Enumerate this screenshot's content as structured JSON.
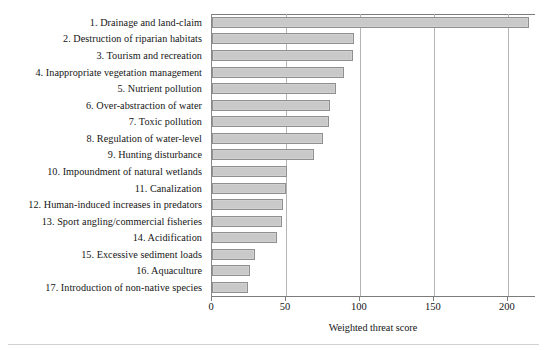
{
  "chart_data": {
    "type": "bar",
    "orientation": "horizontal",
    "title": "",
    "xlabel": "Weighted threat score",
    "ylabel": "",
    "xlim": [
      0,
      219
    ],
    "xticks": [
      0,
      50,
      100,
      150,
      200
    ],
    "xtick_labels": [
      "0",
      "50",
      "100",
      "150",
      "200"
    ],
    "grid": "vertical",
    "legend": "none",
    "bar_fill_color": "#c9c9c9",
    "bar_edge_color": "#8f8f8f",
    "categories": [
      "1. Drainage and land-claim",
      "2. Destruction of riparian habitats",
      "3. Tourism and recreation",
      "4. Inappropriate vegetation management",
      "5. Nutrient pollution",
      "6. Over-abstraction of water",
      "7. Toxic pollution",
      "8. Regulation of water-level",
      "9. Hunting disturbance",
      "10. Impoundment of natural wetlands",
      "11. Canalization",
      "12. Human-induced increases in predators",
      "13. Sport angling/commercial fisheries",
      "14. Acidification",
      "15. Excessive sediment loads",
      "16. Aquaculture",
      "17. Introduction of non-native species"
    ],
    "values": [
      214,
      96,
      95,
      89,
      84,
      80,
      79,
      75,
      69,
      51,
      50,
      48,
      47,
      44,
      29,
      26,
      24
    ]
  }
}
